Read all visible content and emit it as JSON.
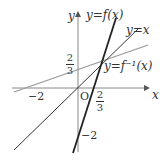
{
  "diagram": {
    "labels": {
      "x_axis": "x",
      "y_axis": "y",
      "origin": "O",
      "f": "y=f(x)",
      "identity": "y=x",
      "f_inverse": "y=f⁻¹(x)",
      "x_neg2": "−2",
      "y_neg2": "−2",
      "frac_num": "2",
      "frac_den": "3"
    },
    "colors": {
      "f": "#222222",
      "identity": "#333333",
      "f_inverse": "#999999",
      "axes": "#888888"
    }
  }
}
